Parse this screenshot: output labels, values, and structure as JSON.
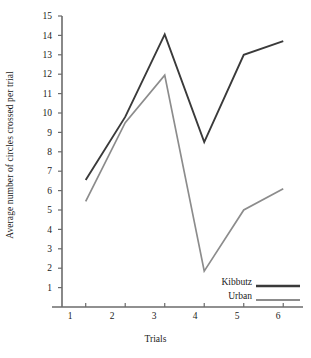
{
  "chart_data": {
    "type": "line",
    "title": "",
    "xlabel": "Trials",
    "ylabel": "Average number of circles crossed per trial",
    "categories": [
      "1",
      "2",
      "3",
      "4",
      "5",
      "6"
    ],
    "x": [
      1,
      2,
      3,
      4,
      5,
      6
    ],
    "xlim": [
      0.4,
      6.5
    ],
    "ylim": [
      0,
      15
    ],
    "yticks": [
      1,
      2,
      3,
      4,
      5,
      6,
      7,
      8,
      9,
      10,
      11,
      12,
      13,
      14,
      15
    ],
    "xticks": [
      1,
      2,
      3,
      4,
      5,
      6
    ],
    "grid": false,
    "legend_position": "lower-right",
    "series": [
      {
        "name": "Kibbutz",
        "color": "#3a3a3a",
        "values": [
          6.55,
          9.8,
          14.05,
          8.5,
          13.0,
          13.7
        ]
      },
      {
        "name": "Urban",
        "color": "#8c8c8c",
        "values": [
          5.45,
          9.5,
          11.95,
          1.85,
          5.0,
          6.1
        ]
      }
    ]
  },
  "axes": {
    "y_title": "Average number of circles crossed per trial",
    "x_title": "Trials",
    "y_tick_labels": [
      "15",
      "14",
      "13",
      "12",
      "11",
      "10",
      "9",
      "8",
      "7",
      "6",
      "5",
      "4",
      "3",
      "2",
      "1"
    ],
    "x_tick_labels": [
      "1",
      "2",
      "3",
      "4",
      "5",
      "6"
    ]
  },
  "legend": {
    "entries": [
      {
        "label": "Kibbutz",
        "color": "#3a3a3a"
      },
      {
        "label": "Urban",
        "color": "#8c8c8c"
      }
    ]
  },
  "style": {
    "axis_color": "#6b6b6b",
    "background": "#ffffff",
    "kibbutz_color": "#3a3a3a",
    "urban_color": "#8c8c8c"
  }
}
